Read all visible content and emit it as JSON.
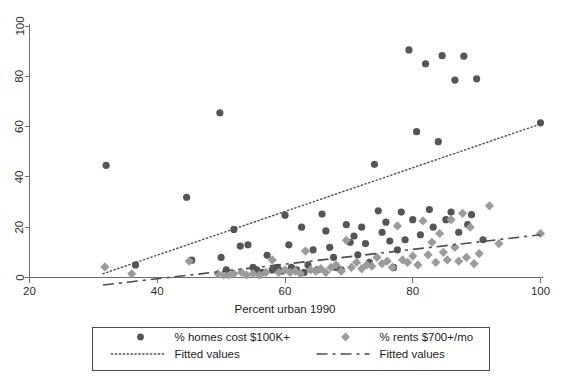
{
  "chart_data": {
    "type": "scatter",
    "title": "",
    "xlabel": "Percent urban 1990",
    "ylabel": "",
    "xlim": [
      20,
      100
    ],
    "ylim": [
      0,
      100
    ],
    "xticks": [
      20,
      40,
      60,
      80,
      100
    ],
    "yticks": [
      0,
      20,
      40,
      60,
      80,
      100
    ],
    "grid": false,
    "legend_position": "below-axes",
    "series": [
      {
        "name": "% homes cost $100K+",
        "marker": "circle",
        "color": "#565656",
        "points": [
          [
            32.0,
            44.6
          ],
          [
            36.6,
            5.0
          ],
          [
            44.6,
            31.9
          ],
          [
            45.4,
            6.9
          ],
          [
            49.8,
            65.5
          ],
          [
            50.0,
            8.0
          ],
          [
            50.8,
            3.0
          ],
          [
            52.0,
            19.1
          ],
          [
            53.0,
            12.5
          ],
          [
            54.2,
            13.0
          ],
          [
            55.0,
            4.0
          ],
          [
            55.6,
            3.0
          ],
          [
            56.5,
            2.0
          ],
          [
            57.2,
            8.8
          ],
          [
            58.0,
            3.0
          ],
          [
            58.8,
            4.0
          ],
          [
            59.4,
            2.5
          ],
          [
            60.0,
            24.8
          ],
          [
            60.6,
            13.0
          ],
          [
            61.0,
            4.0
          ],
          [
            61.8,
            3.0
          ],
          [
            62.6,
            20.0
          ],
          [
            63.0,
            2.0
          ],
          [
            63.6,
            5.0
          ],
          [
            64.4,
            11.0
          ],
          [
            65.0,
            3.0
          ],
          [
            65.8,
            25.2
          ],
          [
            66.4,
            18.5
          ],
          [
            67.0,
            12.0
          ],
          [
            67.6,
            8.0
          ],
          [
            68.0,
            4.0
          ],
          [
            68.8,
            3.0
          ],
          [
            69.6,
            21.0
          ],
          [
            70.2,
            14.0
          ],
          [
            70.8,
            16.5
          ],
          [
            71.4,
            9.0
          ],
          [
            72.0,
            20.0
          ],
          [
            72.6,
            13.5
          ],
          [
            73.2,
            6.0
          ],
          [
            74.0,
            45.0
          ],
          [
            74.6,
            26.5
          ],
          [
            75.2,
            18.0
          ],
          [
            75.8,
            22.0
          ],
          [
            76.4,
            14.5
          ],
          [
            77.0,
            4.0
          ],
          [
            77.6,
            11.0
          ],
          [
            78.2,
            26.0
          ],
          [
            78.8,
            15.0
          ],
          [
            79.4,
            90.5
          ],
          [
            80.0,
            23.0
          ],
          [
            80.6,
            58.0
          ],
          [
            81.2,
            17.0
          ],
          [
            82.0,
            85.0
          ],
          [
            82.6,
            27.0
          ],
          [
            83.2,
            20.0
          ],
          [
            84.0,
            54.0
          ],
          [
            84.6,
            88.2
          ],
          [
            85.2,
            23.0
          ],
          [
            86.0,
            26.0
          ],
          [
            86.6,
            78.5
          ],
          [
            87.2,
            18.0
          ],
          [
            88.0,
            88.0
          ],
          [
            88.6,
            21.0
          ],
          [
            89.2,
            25.0
          ],
          [
            90.0,
            79.0
          ],
          [
            91.0,
            15.0
          ],
          [
            100.0,
            61.5
          ]
        ]
      },
      {
        "name": "% rents $700+/mo",
        "marker": "diamond",
        "color": "#9b9b9b",
        "points": [
          [
            31.8,
            4.2
          ],
          [
            36.0,
            1.5
          ],
          [
            45.0,
            6.5
          ],
          [
            49.5,
            1.5
          ],
          [
            50.4,
            1.0
          ],
          [
            51.2,
            1.0
          ],
          [
            52.0,
            1.5
          ],
          [
            53.2,
            2.0
          ],
          [
            54.0,
            1.0
          ],
          [
            55.0,
            1.5
          ],
          [
            56.0,
            1.0
          ],
          [
            57.0,
            2.0
          ],
          [
            58.0,
            7.0
          ],
          [
            59.0,
            2.0
          ],
          [
            60.0,
            3.0
          ],
          [
            60.8,
            2.0
          ],
          [
            61.6,
            2.5
          ],
          [
            62.4,
            1.5
          ],
          [
            63.2,
            10.5
          ],
          [
            64.0,
            3.0
          ],
          [
            64.8,
            2.5
          ],
          [
            65.6,
            3.5
          ],
          [
            66.4,
            2.0
          ],
          [
            67.2,
            4.0
          ],
          [
            68.0,
            5.0
          ],
          [
            68.8,
            2.5
          ],
          [
            69.6,
            14.8
          ],
          [
            70.4,
            4.0
          ],
          [
            71.2,
            6.0
          ],
          [
            72.0,
            3.5
          ],
          [
            72.8,
            5.0
          ],
          [
            73.6,
            4.5
          ],
          [
            74.4,
            8.0
          ],
          [
            75.2,
            5.5
          ],
          [
            76.0,
            6.5
          ],
          [
            76.8,
            4.0
          ],
          [
            77.6,
            20.5
          ],
          [
            78.4,
            7.0
          ],
          [
            79.2,
            6.0
          ],
          [
            80.0,
            8.5
          ],
          [
            80.8,
            5.0
          ],
          [
            81.6,
            22.5
          ],
          [
            82.4,
            9.0
          ],
          [
            83.0,
            14.0
          ],
          [
            83.6,
            6.0
          ],
          [
            84.2,
            17.5
          ],
          [
            84.8,
            10.0
          ],
          [
            85.4,
            7.0
          ],
          [
            86.0,
            23.0
          ],
          [
            86.6,
            12.0
          ],
          [
            87.2,
            6.5
          ],
          [
            87.8,
            25.5
          ],
          [
            88.4,
            8.0
          ],
          [
            89.0,
            20.0
          ],
          [
            89.6,
            5.5
          ],
          [
            90.4,
            9.5
          ],
          [
            92.0,
            28.5
          ],
          [
            93.5,
            13.5
          ],
          [
            100.0,
            17.5
          ]
        ]
      }
    ],
    "fits": [
      {
        "name": "Fitted values",
        "style": "dotted",
        "for_series": "% homes cost $100K+",
        "x": [
          31.5,
          100.0
        ],
        "y": [
          1.5,
          61.0
        ]
      },
      {
        "name": "Fitted values",
        "style": "dashed",
        "for_series": "% rents $700+/mo",
        "x": [
          31.5,
          100.0
        ],
        "y": [
          -3.0,
          17.0
        ]
      }
    ]
  },
  "legend": {
    "entries": [
      {
        "marker": "circle",
        "label": "% homes cost $100K+"
      },
      {
        "marker": "diamond",
        "label": "% rents $700+/mo"
      },
      {
        "marker": "dotted",
        "label": "Fitted values"
      },
      {
        "marker": "dashed",
        "label": "Fitted values"
      }
    ]
  },
  "colors": {
    "circle": "#565656",
    "diamond": "#9b9b9b",
    "axis": "#6f6f6f",
    "line": "#4d4d4d",
    "background": "#ffffff"
  }
}
